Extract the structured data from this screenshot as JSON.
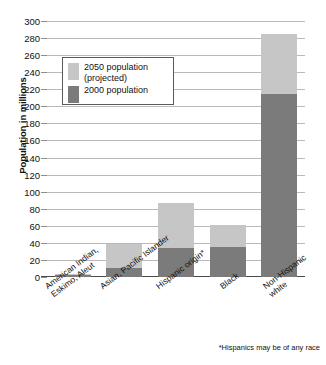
{
  "chart_data": {
    "type": "bar",
    "subtype": "stacked-bar",
    "title": "",
    "xlabel": "",
    "ylabel": "Population in millions",
    "ylim": [
      0,
      300
    ],
    "ytick_step": 20,
    "yticks": [
      300,
      280,
      260,
      240,
      220,
      200,
      180,
      160,
      140,
      120,
      100,
      80,
      60,
      40,
      20,
      0
    ],
    "grid": true,
    "legend_position": "upper-left-inside",
    "categories": [
      "American Indian,\nEskimo, Aleut",
      "Asian, Pacific Islander",
      "Hispanic origin*",
      "Black",
      "Non-Hispanic\nwhite"
    ],
    "series": [
      {
        "name": "2000 population",
        "color": "#7b7b7b",
        "values": [
          2,
          11,
          34,
          35,
          215
        ]
      },
      {
        "name": "2050 population (projected)",
        "color": "#c6c6c6",
        "values": [
          3,
          39,
          87,
          61,
          285
        ]
      }
    ],
    "annotations": [
      "*Hispanics may be of any race"
    ]
  },
  "legend": {
    "items": [
      {
        "label": "2050 population\n(projected)",
        "color": "#c6c6c6"
      },
      {
        "label": "2000 population",
        "color": "#7b7b7b"
      }
    ]
  },
  "footnote": "*Hispanics may be of any race",
  "colors": {
    "projected": "#c6c6c6",
    "population_2000": "#7b7b7b",
    "gridline": "#b9b9b9",
    "axis": "#4a4a4a",
    "background": "#ffffff"
  }
}
